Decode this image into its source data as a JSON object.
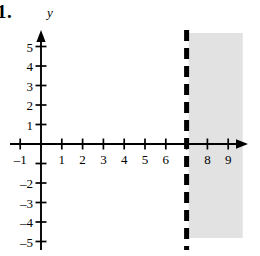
{
  "problem": {
    "number": "1."
  },
  "figure": {
    "y_axis_name": "y",
    "x_axis_name": "",
    "origin": {
      "x_px": 41,
      "y_px": 144
    },
    "unit_px": {
      "x": 20.8,
      "y": 19.5
    },
    "axis_color": "#000000",
    "shade_color": "#e2e2e2",
    "dash_color": "#000000"
  },
  "chart_data": {
    "type": "line",
    "title": "",
    "xlabel": "",
    "ylabel": "y",
    "xlim": [
      -1.6,
      10.2
    ],
    "ylim": [
      -5.7,
      5.8
    ],
    "grid": false,
    "legend": null,
    "x_ticks": [
      -1,
      1,
      2,
      3,
      4,
      5,
      6,
      7,
      8,
      9
    ],
    "x_tick_labels": [
      "-1",
      "1",
      "2",
      "3",
      "4",
      "5",
      "6",
      "",
      "8",
      "9"
    ],
    "y_ticks": [
      5,
      4,
      3,
      2,
      1,
      -1,
      -2,
      -3,
      -4,
      -5
    ],
    "y_tick_labels": [
      "5",
      "4",
      "3",
      "2",
      "1",
      "",
      "-2",
      "-3",
      "-4",
      "-5"
    ],
    "annotations": [
      {
        "kind": "vertical-dashed-line",
        "x": 7,
        "style": "dashed",
        "thickness_px": 5,
        "label": "x = 7",
        "strict": true
      },
      {
        "kind": "shaded-region",
        "description": "x > 7",
        "x_from": 7,
        "x_to": 9.7,
        "fill": "#e2e2e2"
      }
    ],
    "inequality": "x > 7"
  }
}
